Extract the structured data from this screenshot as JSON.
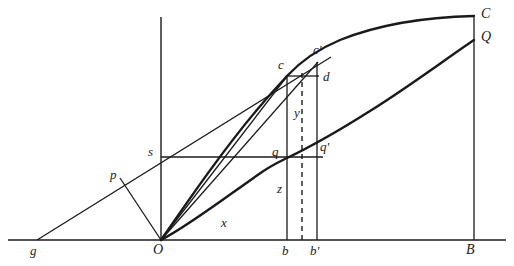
{
  "figure": {
    "background_color": "#ffffff",
    "stroke_color": "#1a1a1a",
    "width": 514,
    "height": 266
  },
  "axes": {
    "x_axis": {
      "name": "horizontal-baseline",
      "y": 240,
      "x_start": 8,
      "x_end": 506
    },
    "y_axis": {
      "name": "vertical-axis",
      "x": 161,
      "y_top": 17,
      "y_bottom": 240
    }
  },
  "points": {
    "O": {
      "label": "O",
      "x": 161,
      "y": 240,
      "label_x": 155,
      "label_y": 244,
      "size": "upper"
    },
    "g": {
      "label": "g",
      "x": 37,
      "y": 240,
      "label_x": 31,
      "label_y": 244,
      "size": "lower"
    },
    "B": {
      "label": "B",
      "x": 474,
      "y": 240,
      "label_x": 468,
      "label_y": 244,
      "size": "upper"
    },
    "b": {
      "label": "b",
      "x": 287,
      "y": 240,
      "label_x": 282,
      "label_y": 244,
      "size": "lower"
    },
    "bprime": {
      "label": "b'",
      "x": 317,
      "y": 240,
      "label_x": 311,
      "label_y": 244,
      "size": "lower"
    },
    "p": {
      "label": "p",
      "x": 120,
      "y": 178,
      "label_x": 112,
      "label_y": 170,
      "size": "lower"
    },
    "s": {
      "label": "s",
      "x": 161,
      "y": 157,
      "label_x": 150,
      "label_y": 147,
      "size": "lower"
    },
    "q": {
      "label": "q",
      "x": 287,
      "y": 158,
      "label_x": 274,
      "label_y": 147,
      "size": "lower"
    },
    "qprime": {
      "label": "q'",
      "x": 317,
      "y": 153,
      "label_x": 319,
      "label_y": 143,
      "size": "lower"
    },
    "c": {
      "label": "c",
      "x": 287,
      "y": 76,
      "label_x": 280,
      "label_y": 61,
      "size": "lower"
    },
    "cprime": {
      "label": "c'",
      "x": 317,
      "y": 63,
      "label_x": 314,
      "label_y": 47,
      "size": "lower"
    },
    "d": {
      "label": "d",
      "x": 317,
      "y": 76,
      "label_x": 322,
      "label_y": 71,
      "size": "lower"
    },
    "C": {
      "label": "C",
      "x": 474,
      "y": 17,
      "label_x": 481,
      "label_y": 8,
      "size": "upper"
    },
    "Q": {
      "label": "Q",
      "x": 474,
      "y": 40,
      "label_x": 481,
      "label_y": 31,
      "size": "upper"
    }
  },
  "variable_labels": {
    "x": {
      "label": "x",
      "x": 224,
      "y": 222,
      "size": "lower"
    },
    "y": {
      "label": "y",
      "x": 297,
      "y": 112,
      "size": "lower"
    },
    "z": {
      "label": "z",
      "x": 280,
      "y": 188,
      "size": "lower"
    }
  },
  "segments": {
    "secant_g_to_cprime": {
      "name": "secant-line-g-cprime",
      "from": [
        37,
        240
      ],
      "to": [
        330,
        57
      ],
      "weight": 1
    },
    "chord_O_to_p": {
      "name": "chord-O-p",
      "from": [
        161,
        240
      ],
      "to": [
        120,
        178
      ],
      "weight": 1
    },
    "chord_O_to_c": {
      "name": "chord-O-c",
      "from": [
        161,
        240
      ],
      "to": [
        287,
        76
      ],
      "weight": 1
    },
    "chord_O_to_cprime": {
      "name": "chord-O-cprime",
      "from": [
        161,
        240
      ],
      "to": [
        317,
        63
      ],
      "weight": 1
    },
    "horizontal_s_to_qprime": {
      "name": "horizontal-line-s-qprime",
      "from": [
        161,
        157
      ],
      "to": [
        322,
        157
      ],
      "weight": 1
    },
    "vertical_b": {
      "name": "ordinate-line-at-b",
      "from": [
        287,
        240
      ],
      "to": [
        287,
        76
      ],
      "weight": 1
    },
    "vertical_bprime": {
      "name": "ordinate-line-at-bprime",
      "from": [
        317,
        240
      ],
      "to": [
        317,
        63
      ],
      "weight": 1
    },
    "vertical_B": {
      "name": "ordinate-line-at-B",
      "from": [
        474,
        240
      ],
      "to": [
        474,
        17
      ],
      "weight": 1
    },
    "horizontal_c_to_d": {
      "name": "horizontal-line-c-d",
      "from": [
        287,
        76
      ],
      "to": [
        318,
        76
      ],
      "weight": 1
    },
    "horizontal_top_C": {
      "name": "horizontal-line-to-C",
      "from": [
        455,
        19
      ],
      "to": [
        474,
        17
      ],
      "weight": 1
    },
    "dashed_ordinate": {
      "name": "dashed-ordinate-line",
      "from": [
        302,
        240
      ],
      "to": [
        302,
        70
      ],
      "weight": 1,
      "dashed": true
    }
  },
  "curves": {
    "curve_OC": {
      "name": "upper-curve-O-to-C",
      "weight": 2,
      "path": "M 161 240 C 200 182, 250 118, 287 76 C 320 40, 400 20, 474 17"
    },
    "curve_OQ": {
      "name": "lower-curve-O-to-Q",
      "weight": 2,
      "path": "M 161 240 C 200 212, 250 178, 287 158 C 340 130, 420 82, 474 40"
    }
  }
}
